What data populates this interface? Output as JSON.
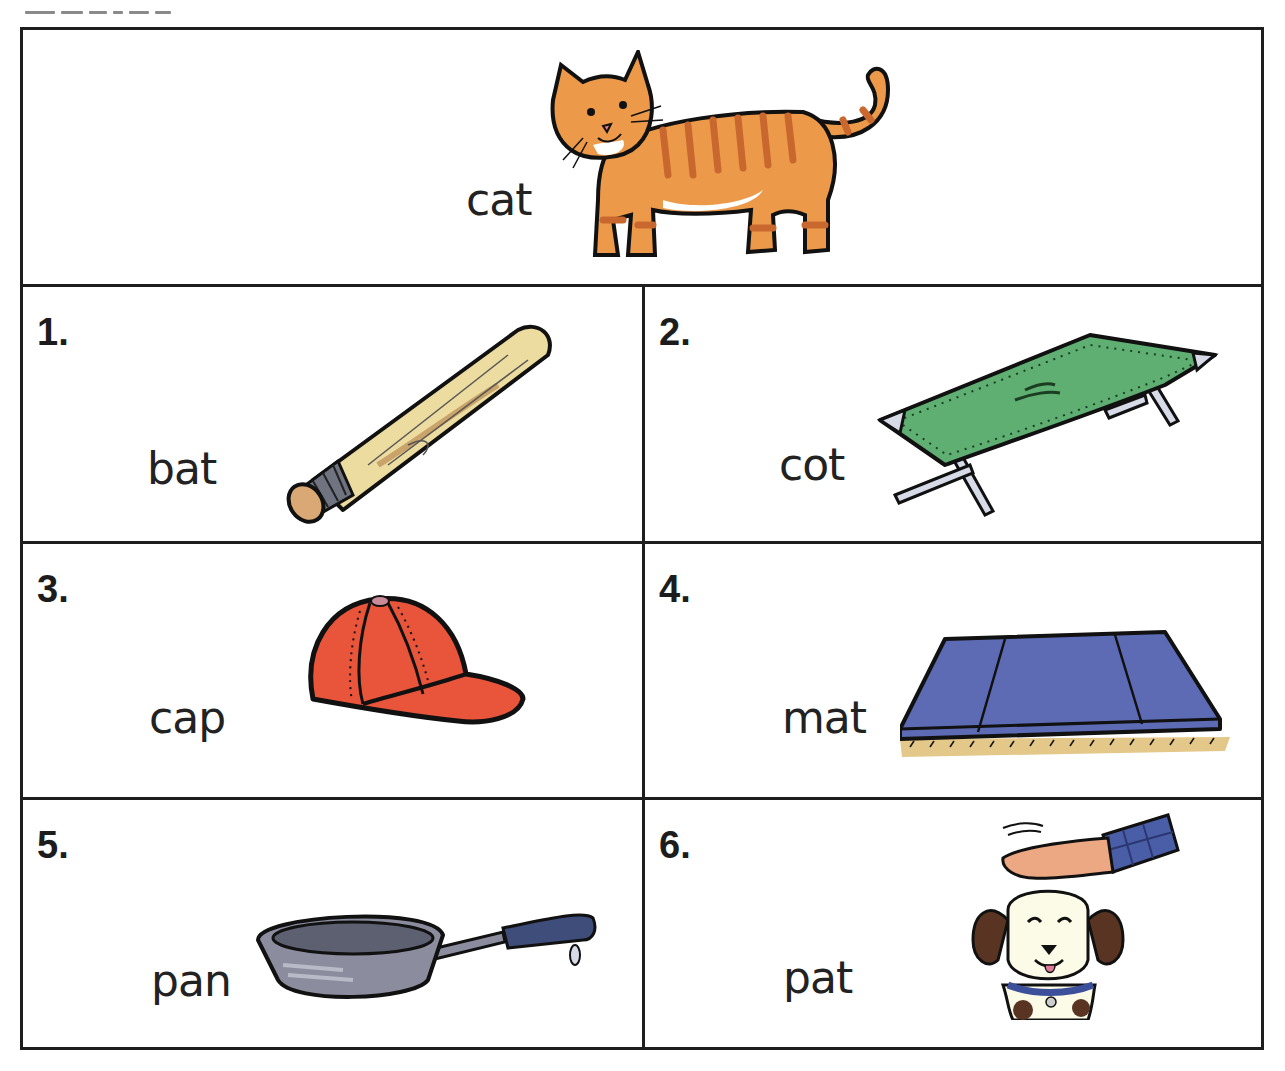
{
  "worksheet": {
    "example": {
      "word": "cat",
      "picture": "cat-picture"
    },
    "items": [
      {
        "number": "1.",
        "word": "bat",
        "picture": "baseball-bat-picture"
      },
      {
        "number": "2.",
        "word": "cot",
        "picture": "cot-picture"
      },
      {
        "number": "3.",
        "word": "cap",
        "picture": "baseball-cap-picture"
      },
      {
        "number": "4.",
        "word": "mat",
        "picture": "mat-picture"
      },
      {
        "number": "5.",
        "word": "pan",
        "picture": "frying-pan-picture"
      },
      {
        "number": "6.",
        "word": "pat",
        "picture": "hand-patting-dog-picture"
      }
    ]
  },
  "colors": {
    "border": "#1e1e1e",
    "cat_orange": "#ec9a4a",
    "cat_stripe": "#c9682e",
    "bat_wood": "#ecdca0",
    "cot_green": "#5fae72",
    "cap_red": "#e8553a",
    "mat_blue": "#5c6bb3",
    "pan_gray": "#8b8d9e",
    "dog_ear": "#5a3422"
  }
}
